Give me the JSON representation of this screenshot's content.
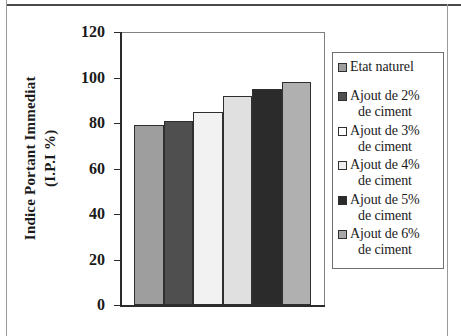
{
  "chart_data": {
    "type": "bar",
    "title": "",
    "xlabel": "",
    "ylabel_line1": "Indice Portant Immediat",
    "ylabel_line2": "(I.P.I %)",
    "ylim": [
      0,
      120
    ],
    "yticks": [
      "0",
      "20",
      "40",
      "60",
      "80",
      "100",
      "120"
    ],
    "ytick_values": [
      0,
      20,
      40,
      60,
      80,
      100,
      120
    ],
    "grid": false,
    "legend_position": "right",
    "categories": [
      "Etat naturel",
      "Ajout de 2% de ciment",
      "Ajout de 3% de ciment",
      "Ajout de 4% de ciment",
      "Ajout de 5% de ciment",
      "Ajout de 6% de ciment"
    ],
    "values": [
      79,
      81,
      85,
      92,
      95,
      98
    ],
    "colors": [
      "#9e9e9e",
      "#4f4f4f",
      "#f2f2f2",
      "#e0e0e0",
      "#2b2b2b",
      "#b0b0b0"
    ]
  },
  "axis": {
    "ticks": [
      {
        "label": "120",
        "value": 120
      },
      {
        "label": "100",
        "value": 100
      },
      {
        "label": "80",
        "value": 80
      },
      {
        "label": "60",
        "value": 60
      },
      {
        "label": "40",
        "value": 40
      },
      {
        "label": "20",
        "value": 20
      },
      {
        "label": "0",
        "value": 0
      }
    ]
  },
  "legend": {
    "items": [
      {
        "line1": "Etat naturel",
        "line2": "",
        "color": "#9e9e9e"
      },
      {
        "line1": "Ajout de 2%",
        "line2": "de ciment",
        "color": "#4f4f4f"
      },
      {
        "line1": "Ajout de 3%",
        "line2": "de ciment",
        "color": "#ffffff"
      },
      {
        "line1": "Ajout de 4%",
        "line2": "de ciment",
        "color": "#ededed"
      },
      {
        "line1": "Ajout de 5%",
        "line2": "de ciment",
        "color": "#2b2b2b"
      },
      {
        "line1": "Ajout de 6%",
        "line2": "de ciment",
        "color": "#a8a8a8"
      }
    ]
  }
}
